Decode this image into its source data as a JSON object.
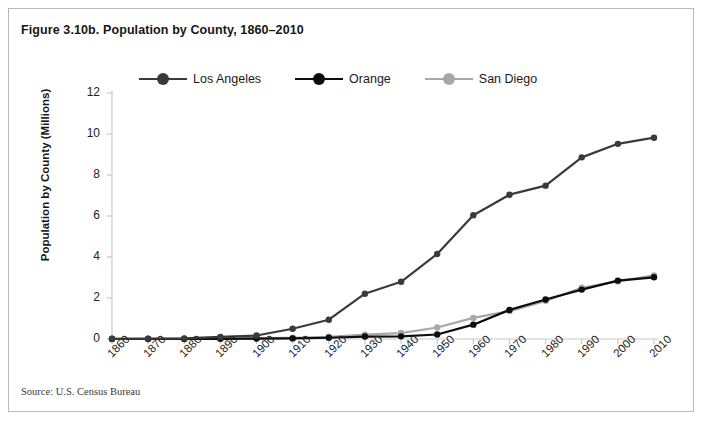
{
  "figure": {
    "title": "Figure 3.10b. Population by County, 1860–2010",
    "source": "Source: U.S. Census Bureau"
  },
  "legend": {
    "position": "top-center",
    "items": [
      {
        "label": "Los Angeles",
        "color": "#3a3a3a"
      },
      {
        "label": "Orange",
        "color": "#0d0d0d"
      },
      {
        "label": "San Diego",
        "color": "#a8a8a8"
      }
    ]
  },
  "chart_data": {
    "type": "line",
    "title": "Figure 3.10b. Population by County, 1860–2010",
    "xlabel": "",
    "ylabel": "Population by County (Millions)",
    "x": [
      1860,
      1870,
      1880,
      1890,
      1900,
      1910,
      1920,
      1930,
      1940,
      1950,
      1960,
      1970,
      1980,
      1990,
      2000,
      2010
    ],
    "categories": [
      "1860",
      "1870",
      "1880",
      "1890",
      "1900",
      "1910",
      "1920",
      "1930",
      "1940",
      "1950",
      "1960",
      "1970",
      "1980",
      "1990",
      "2000",
      "2010"
    ],
    "ylim": [
      0,
      12
    ],
    "yticks": [
      0,
      2,
      4,
      6,
      8,
      10,
      12
    ],
    "ytick_labels": [
      "0",
      "2",
      "4",
      "6",
      "8",
      "10",
      "12"
    ],
    "grid": false,
    "legend_position": "top-center",
    "series": [
      {
        "name": "Los Angeles",
        "color": "#3a3a3a",
        "values": [
          0.01,
          0.02,
          0.03,
          0.1,
          0.17,
          0.5,
          0.94,
          2.21,
          2.79,
          4.15,
          6.04,
          7.04,
          7.48,
          8.86,
          9.52,
          9.82
        ]
      },
      {
        "name": "Orange",
        "color": "#0d0d0d",
        "values": [
          0.0,
          0.0,
          0.0,
          0.01,
          0.02,
          0.03,
          0.06,
          0.12,
          0.13,
          0.22,
          0.7,
          1.42,
          1.93,
          2.41,
          2.85,
          3.01
        ]
      },
      {
        "name": "San Diego",
        "color": "#a8a8a8",
        "values": [
          0.01,
          0.01,
          0.02,
          0.03,
          0.04,
          0.06,
          0.11,
          0.21,
          0.29,
          0.56,
          1.03,
          1.36,
          1.86,
          2.5,
          2.81,
          3.1
        ]
      }
    ]
  },
  "axes": {
    "y_title": "Population by County (Millions)"
  }
}
